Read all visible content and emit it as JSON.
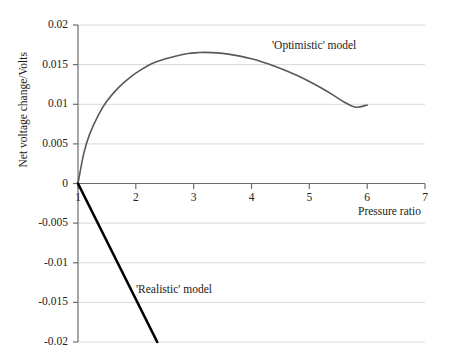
{
  "chart_data": {
    "type": "line",
    "title": "",
    "xlabel": "Pressure ratio",
    "ylabel": "Net voltage change/Volts",
    "xlim": [
      1,
      7
    ],
    "ylim": [
      -0.02,
      0.02
    ],
    "grid": true,
    "legend_position": "inline-annotations",
    "x_ticks": [
      "1",
      "2",
      "3",
      "4",
      "5",
      "6",
      "7"
    ],
    "x_tick_values": [
      1,
      2,
      3,
      4,
      5,
      6,
      7
    ],
    "y_ticks": [
      "0.02",
      "0.015",
      "0.01",
      "0.005",
      "0",
      "-0.005",
      "-0.01",
      "-0.015",
      "-0.02"
    ],
    "y_tick_values": [
      0.02,
      0.015,
      0.01,
      0.005,
      0,
      -0.005,
      -0.01,
      -0.015,
      -0.02
    ],
    "series": [
      {
        "name": "'Optimistic' model",
        "color": "#595959",
        "width": 1.6,
        "x": [
          1.0,
          1.1,
          1.2,
          1.35,
          1.5,
          1.7,
          1.9,
          2.1,
          2.3,
          2.5,
          2.7,
          2.9,
          3.1,
          3.2,
          3.4,
          3.6,
          3.8,
          4.0,
          4.2,
          4.4,
          4.6,
          4.8,
          5.0,
          5.2,
          5.4,
          5.6,
          5.8,
          6.0
        ],
        "values": [
          0.0,
          0.0038,
          0.0062,
          0.0086,
          0.0104,
          0.0121,
          0.0134,
          0.0144,
          0.0152,
          0.0157,
          0.0161,
          0.0164,
          0.01653,
          0.01655,
          0.01648,
          0.01632,
          0.01607,
          0.01573,
          0.01531,
          0.01481,
          0.01424,
          0.01359,
          0.01287,
          0.01208,
          0.01122,
          0.01029,
          0.00963,
          0.0099
        ]
      },
      {
        "name": "'Realistic' model",
        "color": "#000000",
        "width": 2.6,
        "x": [
          1.0,
          2.37
        ],
        "values": [
          0.0,
          -0.02
        ]
      }
    ],
    "annotations": [
      {
        "text": "'Optimistic' model",
        "x": 4.35,
        "y": 0.0183
      },
      {
        "text": "'Realistic' model",
        "x": 2.0,
        "y": -0.0132
      }
    ]
  }
}
